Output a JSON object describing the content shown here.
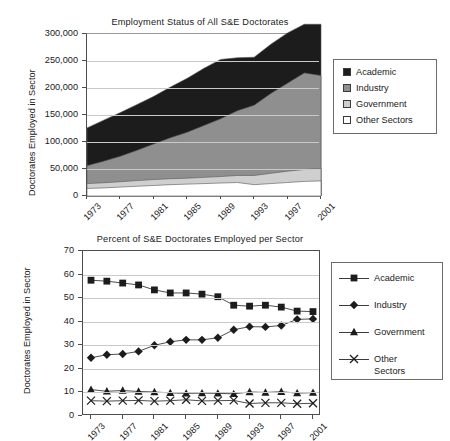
{
  "chart_data": [
    {
      "type": "area",
      "stacked": true,
      "title": "Employment Status of All S&E Doctorates",
      "xlabel": "",
      "ylabel": "Doctorates Employed in Sector",
      "ylim": [
        0,
        300000
      ],
      "yticks": [
        0,
        50000,
        100000,
        150000,
        200000,
        250000,
        300000
      ],
      "ytick_labels": [
        "0",
        "50,000",
        "100,000",
        "150,000",
        "200,000",
        "250,000",
        "300,000"
      ],
      "grid": true,
      "legend_position": "right",
      "x": [
        1973,
        1975,
        1977,
        1979,
        1981,
        1983,
        1985,
        1987,
        1989,
        1991,
        1993,
        1995,
        1997,
        1999,
        2001
      ],
      "xtick_labels": [
        "1973",
        "1977",
        "1981",
        "1985",
        "1989",
        "1993",
        "1997",
        "2001"
      ],
      "series": [
        {
          "name": "Other Sectors",
          "color": "#ffffff",
          "values": [
            14000,
            15000,
            16500,
            18000,
            19500,
            21000,
            22000,
            23000,
            24000,
            25000,
            21000,
            23000,
            25000,
            27000,
            28000
          ]
        },
        {
          "name": "Government",
          "color": "#cfcfcf",
          "values": [
            9000,
            9500,
            10000,
            10500,
            11000,
            11000,
            11000,
            11500,
            12000,
            13000,
            17000,
            19000,
            21000,
            22000,
            23000
          ]
        },
        {
          "name": "Industry",
          "color": "#8f8f8f",
          "values": [
            33000,
            40000,
            47000,
            56000,
            66000,
            76000,
            85000,
            96000,
            107000,
            120000,
            130000,
            148000,
            163000,
            179000,
            172000
          ]
        },
        {
          "name": "Academic",
          "color": "#1c1c1c",
          "values": [
            70000,
            76000,
            81000,
            85000,
            88000,
            94000,
            100000,
            106000,
            110000,
            98000,
            89000,
            91000,
            93000,
            90000,
            95000
          ]
        }
      ],
      "legend_entries": [
        {
          "label": "Academic",
          "color": "#1c1c1c"
        },
        {
          "label": "Industry",
          "color": "#8f8f8f"
        },
        {
          "label": "Government",
          "color": "#cfcfcf"
        },
        {
          "label": "Other Sectors",
          "color": "#ffffff"
        }
      ]
    },
    {
      "type": "line",
      "title": "Percent of S&E Doctorates Employed per Sector",
      "xlabel": "",
      "ylabel": "Doctorates Employed in Sector",
      "ylim": [
        0,
        70
      ],
      "yticks": [
        0,
        10,
        20,
        30,
        40,
        50,
        60,
        70
      ],
      "ytick_labels": [
        "0",
        "10",
        "20",
        "30",
        "40",
        "50",
        "60",
        "70"
      ],
      "grid": true,
      "legend_position": "right",
      "x": [
        1973,
        1975,
        1977,
        1979,
        1981,
        1983,
        1985,
        1987,
        1989,
        1991,
        1993,
        1995,
        1997,
        1999,
        2001
      ],
      "xtick_labels": [
        "1973",
        "1977",
        "1981",
        "1985",
        "1989",
        "1993",
        "1997",
        "2001"
      ],
      "series": [
        {
          "name": "Academic",
          "marker": "square",
          "values": [
            57.6,
            57.2,
            56.4,
            55.6,
            53.5,
            52.2,
            52.2,
            51.7,
            50.6,
            47.0,
            46.6,
            47.0,
            46.2,
            44.5,
            44.3
          ]
        },
        {
          "name": "Industry",
          "marker": "diamond",
          "values": [
            24.7,
            26.0,
            26.3,
            27.4,
            30.0,
            31.5,
            32.3,
            32.3,
            33.2,
            36.6,
            37.9,
            37.8,
            38.4,
            41.0,
            41.2
          ]
        },
        {
          "name": "Government",
          "marker": "triangle",
          "values": [
            11.2,
            10.5,
            10.8,
            10.4,
            10.2,
            9.8,
            9.6,
            9.7,
            9.6,
            9.4,
            10.2,
            10.0,
            10.3,
            9.7,
            9.9
          ]
        },
        {
          "name": "Other Sectors",
          "marker": "cross",
          "values": [
            6.5,
            6.3,
            6.5,
            6.6,
            6.3,
            6.5,
            6.9,
            6.4,
            6.5,
            6.6,
            5.3,
            5.6,
            5.6,
            5.2,
            5.4
          ]
        }
      ],
      "legend_entries": [
        {
          "label": "Academic",
          "marker": "square"
        },
        {
          "label": "Industry",
          "marker": "diamond"
        },
        {
          "label": "Government",
          "marker": "triangle"
        },
        {
          "label": "Other",
          "label2": "Sectors",
          "marker": "cross"
        }
      ]
    }
  ]
}
